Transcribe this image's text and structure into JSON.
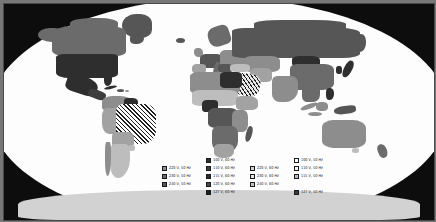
{
  "figure": {
    "kind": "world-map",
    "projection": "robinson",
    "background_color": "#0d0d0d",
    "ocean_color": "#fdfdfd"
  },
  "legend": {
    "columns": 4,
    "rows": 5,
    "items": [
      {
        "row": 1,
        "col": 2,
        "label": "100 V, 60 Hz",
        "swatch": "#2e2e2e"
      },
      {
        "row": 1,
        "col": 4,
        "label": "100 V, 50 Hz",
        "swatch": "#fdfdfd"
      },
      {
        "row": 2,
        "col": 1,
        "label": "220 V, 50 Hz",
        "swatch": "#8d8d8d"
      },
      {
        "row": 2,
        "col": 2,
        "label": "110 V, 60 Hz",
        "swatch": "#3d3d3d"
      },
      {
        "row": 2,
        "col": 3,
        "label": "220 V, 60 Hz",
        "swatch": "#d2d2d2"
      },
      {
        "row": 2,
        "col": 4,
        "label": "110 V, 50 Hz",
        "swatch": "#f2f2f2"
      },
      {
        "row": 3,
        "col": 1,
        "label": "230 V, 50 Hz",
        "swatch": "#6b6b6b"
      },
      {
        "row": 3,
        "col": 2,
        "label": "115 V, 60 Hz",
        "swatch": "#2e2e2e"
      },
      {
        "row": 3,
        "col": 3,
        "label": "230 V, 60 Hz",
        "swatch": "#e6e6e6"
      },
      {
        "row": 3,
        "col": 4,
        "label": "115 V, 50 Hz",
        "swatch": "#bdbdbd"
      },
      {
        "row": 4,
        "col": 1,
        "label": "240 V, 50 Hz",
        "swatch": "#565656"
      },
      {
        "row": 4,
        "col": 2,
        "label": "120 V, 60 Hz",
        "swatch": "#4a4a4a"
      },
      {
        "row": 4,
        "col": 3,
        "label": "240 V, 60 Hz",
        "swatch": "#c4c4c4"
      },
      {
        "row": 5,
        "col": 2,
        "label": "127 V, 60 Hz",
        "swatch": "#1f1f1f"
      },
      {
        "row": 5,
        "col": 4,
        "label": "127 V, 50 Hz",
        "swatch": "#3d3d3d"
      }
    ]
  }
}
